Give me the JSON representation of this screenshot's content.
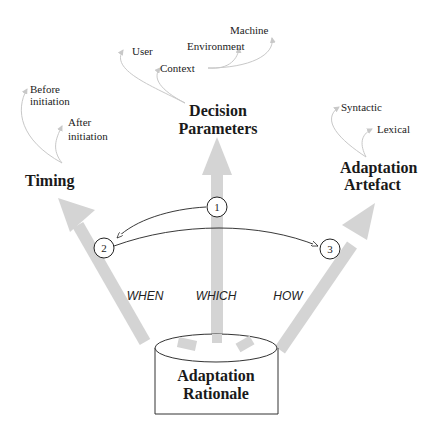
{
  "diagram": {
    "source": {
      "line1": "Adaptation",
      "line2": "Rationale"
    },
    "branches": {
      "timing": {
        "title": "Timing",
        "question": "WHEN",
        "children": [
          {
            "line1": "Before",
            "line2": "initiation"
          },
          {
            "line1": "After",
            "line2": "initiation"
          }
        ]
      },
      "decision": {
        "title_line1": "Decision",
        "title_line2": "Parameters",
        "question": "WHICH",
        "children": [
          "User",
          "Context"
        ],
        "context_children": [
          "Environment",
          "Machine"
        ]
      },
      "artefact": {
        "title_line1": "Adaptation",
        "title_line2": "Artefact",
        "question": "HOW",
        "children": [
          "Syntactic",
          "Lexical"
        ]
      }
    },
    "steps": [
      "1",
      "2",
      "3"
    ],
    "colors": {
      "arrow": "#d4d4d4",
      "text": "#1a1a1a",
      "curve": "#c8c8c8",
      "line": "#222222"
    }
  }
}
